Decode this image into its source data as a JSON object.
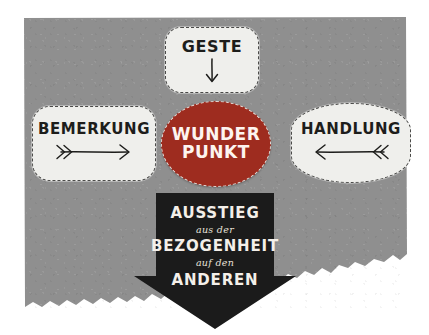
{
  "figure": {
    "kind": "hand-drawn-concept-diagram",
    "background_color": "#ffffff",
    "paper_color": "#8f8f8f"
  },
  "nodes": {
    "top": {
      "label": "GESTE",
      "arrow_icon": "arrow-down-icon",
      "arrow_direction": "down",
      "fill": "#efefec",
      "text_color": "#1d1d1b",
      "border_style": "dashed"
    },
    "left": {
      "label": "BEMERKUNG",
      "arrow_icon": "arrow-right-icon",
      "arrow_direction": "right",
      "fill": "#efefec",
      "text_color": "#1d1d1b",
      "border_style": "dashed"
    },
    "right": {
      "label": "HANDLUNG",
      "arrow_icon": "arrow-left-icon",
      "arrow_direction": "left",
      "fill": "#efefec",
      "text_color": "#1d1d1b",
      "border_style": "dashed"
    },
    "center": {
      "label_line1": "WUNDER",
      "label_line2": "PUNKT",
      "fill": "#9e2c1f",
      "text_color": "#fdf4f0",
      "border_style": "dashed",
      "shape": "ellipse"
    }
  },
  "banner": {
    "shape": "down-arrow",
    "fill": "#1b1b1b",
    "text_color": "#f4efe9",
    "lines": [
      {
        "text": "AUSSTIEG",
        "style": "caps"
      },
      {
        "text": "aus der",
        "style": "script"
      },
      {
        "text": "BEZOGENHEIT",
        "style": "caps"
      },
      {
        "text": "auf den",
        "style": "script"
      },
      {
        "text": "ANDEREN",
        "style": "caps"
      }
    ]
  }
}
